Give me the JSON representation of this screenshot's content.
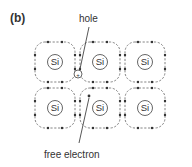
{
  "panel_label": "(b)",
  "atom_label": "Si",
  "lattice": {
    "rows": 2,
    "cols": 3
  },
  "annotations": {
    "hole": "hole",
    "free_electron": "free electron"
  },
  "hole_symbol": "+",
  "colors": {
    "line": "#555555",
    "dot": "#333333",
    "text": "#333333",
    "background": "#ffffff"
  }
}
